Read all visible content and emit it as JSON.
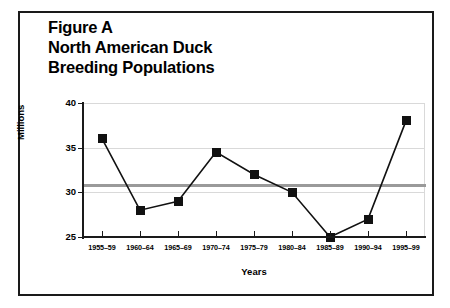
{
  "figure": {
    "title_lines": [
      "Figure A",
      "North American Duck",
      "Breeding Populations"
    ],
    "frame_color": "#1a1a1a"
  },
  "axes": {
    "y_title": "Millions",
    "x_title": "Years"
  },
  "chart_data": {
    "type": "line",
    "title": "Figure A North American Duck Breeding Populations",
    "xlabel": "Years",
    "ylabel": "Millions",
    "categories": [
      "1955–59",
      "1960–64",
      "1965–69",
      "1970–74",
      "1975–79",
      "1980–84",
      "1985–89",
      "1990–94",
      "1995–99"
    ],
    "values": [
      36,
      28,
      29,
      34.5,
      32,
      30,
      25,
      27,
      38
    ],
    "series": [
      {
        "name": "North American Duck Breeding Population",
        "values": [
          36,
          28,
          29,
          34.5,
          32,
          30,
          25,
          27,
          38
        ],
        "line_color": "#111111",
        "marker": "square",
        "marker_color": "#111111"
      }
    ],
    "reference_line": {
      "label": "Long-term average",
      "value": 30.8,
      "color": "#9a9a9a"
    },
    "ylim": [
      25,
      40
    ],
    "yticks": [
      25,
      30,
      35,
      40
    ],
    "ytick_labels": [
      "25",
      "30",
      "35",
      "40"
    ],
    "grid": true,
    "grid_color": "#d9d9d9",
    "legend": "none"
  }
}
